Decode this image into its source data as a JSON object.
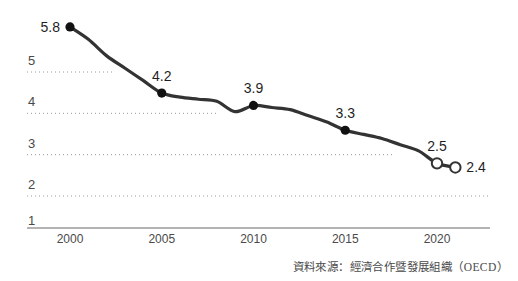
{
  "chart_data": {
    "type": "line",
    "title": "",
    "xlabel": "",
    "ylabel": "",
    "xlim": [
      1999,
      2022
    ],
    "ylim": [
      1,
      6.2
    ],
    "grid": true,
    "legend": null,
    "y_ticks": [
      "5",
      "4",
      "3",
      "2",
      "1"
    ],
    "y_tick_values": [
      5,
      4,
      3,
      2,
      1
    ],
    "x_ticks": [
      "2000",
      "2005",
      "2010",
      "2015",
      "2020"
    ],
    "x_tick_values": [
      2000,
      2005,
      2010,
      2015,
      2020
    ],
    "series": [
      {
        "name": "series-1",
        "x": [
          2000,
          2001,
          2002,
          2003,
          2004,
          2005,
          2006,
          2007,
          2008,
          2009,
          2010,
          2011,
          2012,
          2013,
          2014,
          2015,
          2016,
          2017,
          2018,
          2019,
          2020,
          2021
        ],
        "values": [
          5.8,
          5.5,
          5.1,
          4.8,
          4.5,
          4.2,
          4.1,
          4.05,
          4.0,
          3.75,
          3.9,
          3.85,
          3.8,
          3.65,
          3.5,
          3.3,
          3.2,
          3.1,
          2.95,
          2.8,
          2.5,
          2.4
        ]
      }
    ],
    "labeled_points": [
      {
        "label": "5.8",
        "x": 2000,
        "y": 5.8,
        "marker": "filled",
        "label_side": "left"
      },
      {
        "label": "4.2",
        "x": 2005,
        "y": 4.2,
        "marker": "filled",
        "label_side": "above"
      },
      {
        "label": "3.9",
        "x": 2010,
        "y": 3.9,
        "marker": "filled",
        "label_side": "above"
      },
      {
        "label": "3.3",
        "x": 2015,
        "y": 3.3,
        "marker": "filled",
        "label_side": "above"
      },
      {
        "label": "2.5",
        "x": 2020,
        "y": 2.5,
        "marker": "hollow",
        "label_side": "above"
      },
      {
        "label": "2.4",
        "x": 2021,
        "y": 2.4,
        "marker": "hollow",
        "label_side": "right"
      }
    ],
    "colors": {
      "line": "#333333",
      "marker_fill": "#111111",
      "marker_hollow_fill": "#ffffff",
      "grid": "#9a9a9a",
      "axis": "#9a9a9a",
      "text": "#3a3a3a"
    }
  },
  "footer": {
    "source_note": "資料來源：經濟合作暨發展組織（OECD）"
  }
}
